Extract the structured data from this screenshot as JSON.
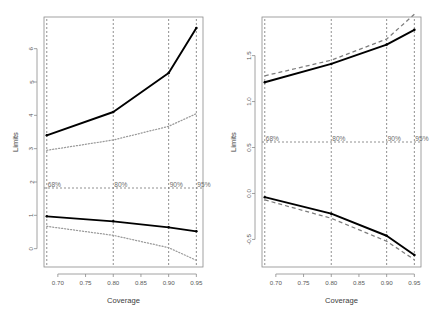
{
  "figure": {
    "title": "",
    "background": "#ffffff",
    "panel_count": 2
  },
  "chart_data": [
    {
      "type": "line",
      "panel": "left",
      "title": "",
      "xlabel": "Coverage",
      "ylabel": "Limits",
      "xlim": [
        0.675,
        0.962
      ],
      "ylim": [
        -0.55,
        6.95
      ],
      "xticks": [
        0.7,
        0.75,
        0.8,
        0.85,
        0.9,
        0.95
      ],
      "xticklabels": [
        "0.70",
        "0.75",
        "0.80",
        "0.85",
        "0.90",
        "0.95"
      ],
      "yticks": [
        0,
        1,
        2,
        3,
        4,
        5,
        6
      ],
      "yticklabels": [
        "0",
        "1",
        "2",
        "3",
        "4",
        "5",
        "6"
      ],
      "grid": false,
      "legend": "none",
      "x": [
        0.68,
        0.8,
        0.9,
        0.95
      ],
      "series": [
        {
          "name": "upper-solid-limit",
          "style": "solid",
          "color": "#000000",
          "values": [
            3.4,
            4.1,
            5.27,
            6.62
          ]
        },
        {
          "name": "upper-dotted-limit",
          "style": "dotted",
          "color": "#9a9a9a",
          "values": [
            2.95,
            3.26,
            3.67,
            4.05
          ]
        },
        {
          "name": "lower-solid-limit",
          "style": "solid",
          "color": "#000000",
          "values": [
            0.97,
            0.82,
            0.64,
            0.52
          ]
        },
        {
          "name": "lower-dotted-limit",
          "style": "dotted",
          "color": "#9a9a9a",
          "values": [
            0.67,
            0.4,
            0.03,
            -0.35
          ]
        }
      ],
      "reference_line": {
        "orientation": "horizontal",
        "value": 1.82,
        "style": "dashed"
      },
      "annotations": [
        {
          "label": "68%",
          "x": 0.68
        },
        {
          "label": "80%",
          "x": 0.8
        },
        {
          "label": "90%",
          "x": 0.9
        },
        {
          "label": "95%",
          "x": 0.95
        }
      ]
    },
    {
      "type": "line",
      "panel": "right",
      "title": "",
      "xlabel": "Coverage",
      "ylabel": "Limits",
      "xlim": [
        0.675,
        0.962
      ],
      "ylim": [
        -0.8,
        1.92
      ],
      "xticks": [
        0.7,
        0.75,
        0.8,
        0.85,
        0.9,
        0.95
      ],
      "xticklabels": [
        "0.70",
        "0.75",
        "0.80",
        "0.85",
        "0.90",
        "0.95"
      ],
      "yticks": [
        -0.5,
        0.0,
        0.5,
        1.0,
        1.5
      ],
      "yticklabels": [
        "-0.5",
        "0.0",
        "0.5",
        "1.0",
        "1.5"
      ],
      "grid": false,
      "legend": "none",
      "x": [
        0.68,
        0.8,
        0.9,
        0.95
      ],
      "series": [
        {
          "name": "upper-solid-limit",
          "style": "solid",
          "color": "#000000",
          "values": [
            1.21,
            1.41,
            1.62,
            1.78
          ]
        },
        {
          "name": "upper-dashed-limit",
          "style": "dashed",
          "color": "#7d7d7d",
          "values": [
            1.28,
            1.45,
            1.68,
            1.95
          ]
        },
        {
          "name": "lower-solid-limit",
          "style": "solid",
          "color": "#000000",
          "values": [
            -0.04,
            -0.22,
            -0.46,
            -0.67
          ]
        },
        {
          "name": "lower-dashed-limit",
          "style": "dashed",
          "color": "#7d7d7d",
          "values": [
            -0.07,
            -0.27,
            -0.52,
            -0.72
          ]
        }
      ],
      "reference_line": {
        "orientation": "horizontal",
        "value": 0.56,
        "style": "dashed"
      },
      "annotations": [
        {
          "label": "68%",
          "x": 0.68
        },
        {
          "label": "80%",
          "x": 0.8
        },
        {
          "label": "90%",
          "x": 0.9
        },
        {
          "label": "95%",
          "x": 0.95
        }
      ]
    }
  ]
}
